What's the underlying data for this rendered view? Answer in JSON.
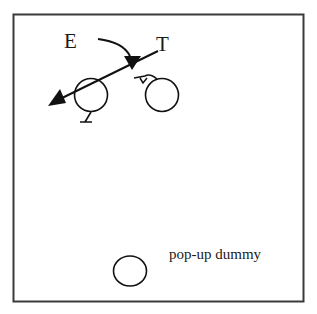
{
  "diagram": {
    "frame": {
      "stroke": "#3a3a3a"
    },
    "labels": {
      "e": "E",
      "t": "T",
      "dummy": "pop-up dummy"
    },
    "elements": [
      {
        "id": "player-e",
        "label": "E",
        "shape": "circle",
        "cx": 91,
        "cy": 95,
        "r": 16,
        "marker": "feet-below"
      },
      {
        "id": "player-t",
        "label": "T",
        "shape": "circle",
        "cx": 162,
        "cy": 95,
        "r": 16,
        "marker": "head-left"
      },
      {
        "id": "pop-up-dummy",
        "label": "pop-up dummy",
        "shape": "ellipse",
        "cx": 130,
        "cy": 271,
        "rx": 17,
        "ry": 15
      }
    ],
    "arrows": [
      {
        "id": "pass-line",
        "from": "T",
        "to": "left",
        "style": "straight",
        "head": "filled-triangle"
      },
      {
        "id": "run-curve",
        "from": "E",
        "to": "T-line",
        "style": "curved",
        "head": "filled-triangle"
      }
    ],
    "colors": {
      "ink": "#111111",
      "background": "#ffffff"
    }
  }
}
